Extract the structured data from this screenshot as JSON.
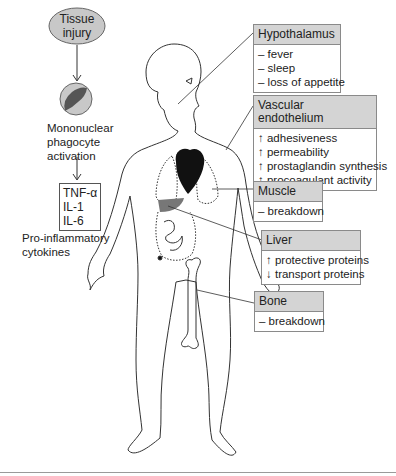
{
  "diagram": {
    "type": "systemic-effects-of-inflammation",
    "left_flow": {
      "trigger": "Tissue injury",
      "cell_label_lines": [
        "Mononuclear",
        "phagocyte",
        "activation"
      ],
      "cytokines": [
        "TNF-α",
        "IL-1",
        "IL-6"
      ],
      "cytokines_label_lines": [
        "Pro-inflammatory",
        "cytokines"
      ]
    },
    "organs": [
      {
        "id": "hypothalamus",
        "title": "Hypothalamus",
        "effects": [
          "– fever",
          "– sleep",
          "– loss of appetite"
        ]
      },
      {
        "id": "vascular-endothelium",
        "title": "Vascular endothelium",
        "effects": [
          "↑ adhesiveness",
          "↑ permeability",
          "↑ prostaglandin synthesis",
          "↑ procoagulant activity"
        ]
      },
      {
        "id": "muscle",
        "title": "Muscle",
        "effects": [
          "– breakdown"
        ]
      },
      {
        "id": "liver",
        "title": "Liver",
        "effects": [
          "↑ protective proteins",
          "↓ transport proteins"
        ]
      },
      {
        "id": "bone",
        "title": "Bone",
        "effects": [
          "– breakdown"
        ]
      }
    ],
    "colors": {
      "header_fill": "#d4d4d4",
      "border": "#8a8a8a",
      "ellipse_fill": "#c8c8c8",
      "cell_nucleus": "#555555",
      "liver_fill": "#777777",
      "heart_fill": "#111111",
      "outline": "#333333"
    }
  }
}
